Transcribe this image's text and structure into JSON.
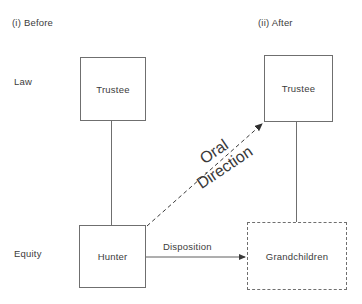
{
  "figure": {
    "panels": [
      {
        "id": "before",
        "label": "(i)  Before"
      },
      {
        "id": "after",
        "label": "(ii)  After"
      }
    ],
    "row_labels": [
      {
        "id": "law",
        "label": "Law"
      },
      {
        "id": "equity",
        "label": "Equity"
      }
    ],
    "nodes": [
      {
        "id": "trustee-before",
        "label": "Trustee",
        "border": "solid",
        "panel": "before",
        "row": "law"
      },
      {
        "id": "hunter",
        "label": "Hunter",
        "border": "solid",
        "panel": "before",
        "row": "equity"
      },
      {
        "id": "trustee-after",
        "label": "Trustee",
        "border": "solid",
        "panel": "after",
        "row": "law"
      },
      {
        "id": "grandchildren",
        "label": "Grandchildren",
        "border": "dashed",
        "panel": "after",
        "row": "equity"
      }
    ],
    "edges": [
      {
        "id": "before-vertical",
        "from": "trustee-before",
        "to": "hunter",
        "style": "solid",
        "arrow": false,
        "label": ""
      },
      {
        "id": "after-vertical",
        "from": "trustee-after",
        "to": "grandchildren",
        "style": "solid",
        "arrow": false,
        "label": ""
      },
      {
        "id": "oral-direction",
        "from": "hunter",
        "to": "trustee-after",
        "style": "dashed",
        "arrow": true,
        "label_line1": "Oral",
        "label_line2": "Direction"
      },
      {
        "id": "disposition",
        "from": "hunter",
        "to": "grandchildren",
        "style": "solid",
        "arrow": true,
        "label": "Disposition"
      }
    ],
    "colors": {
      "line": "#6f6f6f",
      "text": "#3c3c3c",
      "background": "#ffffff"
    }
  }
}
